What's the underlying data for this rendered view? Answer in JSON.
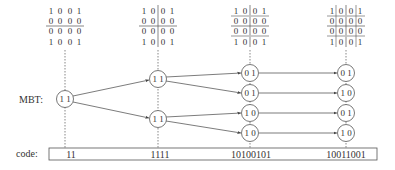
{
  "labels": {
    "mbt": "MBT:",
    "code": "code:"
  },
  "matrices": [
    {
      "rows": [
        [
          "1",
          "0",
          "0",
          "1"
        ],
        [
          "0",
          "0",
          "0",
          "0"
        ],
        [
          "0",
          "0",
          "0",
          "0"
        ],
        [
          "1",
          "0",
          "0",
          "1"
        ]
      ],
      "split": "horizontal"
    },
    {
      "rows": [
        [
          "1",
          "0",
          "0",
          "1"
        ],
        [
          "0",
          "0",
          "0",
          "0"
        ],
        [
          "0",
          "0",
          "0",
          "0"
        ],
        [
          "1",
          "0",
          "0",
          "1"
        ]
      ],
      "split": "quadrant"
    },
    {
      "rows": [
        [
          "1",
          "0",
          "0",
          "1"
        ],
        [
          "0",
          "0",
          "0",
          "0"
        ],
        [
          "0",
          "0",
          "0",
          "0"
        ],
        [
          "1",
          "0",
          "0",
          "1"
        ]
      ],
      "split": "quadrant-halves"
    },
    {
      "rows": [
        [
          "1",
          "0",
          "0",
          "1"
        ],
        [
          "0",
          "0",
          "0",
          "0"
        ],
        [
          "0",
          "0",
          "0",
          "0"
        ],
        [
          "1",
          "0",
          "0",
          "1"
        ]
      ],
      "split": "full"
    }
  ],
  "tree": {
    "levels": [
      {
        "nodes": [
          {
            "text": "1 1"
          }
        ]
      },
      {
        "nodes": [
          {
            "text": "1 1"
          },
          {
            "text": "1 1"
          }
        ]
      },
      {
        "nodes": [
          {
            "text": "0 1"
          },
          {
            "text": "0 1"
          },
          {
            "text": "1 0"
          },
          {
            "text": "1 0"
          }
        ]
      },
      {
        "nodes": [
          {
            "text": "0 1"
          },
          {
            "text": "1 0"
          },
          {
            "text": "0 1"
          },
          {
            "text": "1 0"
          }
        ]
      }
    ]
  },
  "codes": [
    "11",
    "1111",
    "10100101",
    "10011001"
  ]
}
